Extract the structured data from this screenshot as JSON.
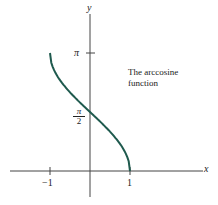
{
  "chart_data": {
    "type": "line",
    "title": "The arccosine function",
    "xlabel": "x",
    "ylabel": "y",
    "x_ticks": [
      {
        "value": -1,
        "label": "-1"
      },
      {
        "value": 1,
        "label": "1"
      }
    ],
    "y_ticks": [
      {
        "value": 1.5708,
        "label": "π/2"
      },
      {
        "value": 3.1416,
        "label": "π"
      }
    ],
    "xlim": [
      -2,
      2.85
    ],
    "ylim": [
      -0.8,
      3.7
    ],
    "grid": false,
    "legend": null,
    "series": [
      {
        "name": "arccos(x)",
        "color": "#1f5a4e",
        "x": [
          -1,
          -0.9,
          -0.75,
          -0.5,
          -0.25,
          0,
          0.25,
          0.5,
          0.75,
          0.9,
          1
        ],
        "y": [
          3.1416,
          2.6906,
          2.4189,
          2.0944,
          1.8235,
          1.5708,
          1.3181,
          1.0472,
          0.7227,
          0.451,
          0
        ]
      }
    ],
    "annotations": [
      {
        "text": "The arccosine function",
        "x": 1.0,
        "y": 2.6
      }
    ]
  },
  "labels": {
    "y_axis": "y",
    "x_axis": "x",
    "pi": "π",
    "pi_num": "π",
    "pi_den": "2",
    "neg_one": "−1",
    "one": "1",
    "note_line1": "The arccosine",
    "note_line2": "function"
  }
}
